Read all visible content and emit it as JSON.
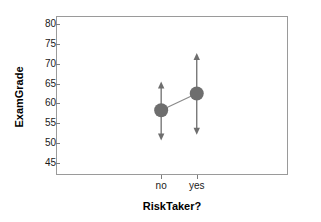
{
  "chart_data": {
    "type": "scatter",
    "title": "",
    "subtitle": "",
    "xlabel": "RiskTaker?",
    "ylabel": "ExamGrade",
    "categories": [
      "no",
      "yes"
    ],
    "values": [
      58.3,
      62.5
    ],
    "error_low": [
      50.7,
      52.1
    ],
    "error_high": [
      65.5,
      72.7
    ],
    "series": [
      {
        "name": "ExamGrade mean",
        "values": [
          58.3,
          62.5
        ],
        "error_low": [
          50.7,
          52.1
        ],
        "error_high": [
          65.5,
          72.7
        ]
      }
    ],
    "ylim": [
      42,
      82
    ],
    "xlim": [
      0,
      1
    ],
    "yticks": [
      45,
      50,
      55,
      60,
      65,
      70,
      75,
      80
    ],
    "ytick_labels": [
      "45",
      "50",
      "55",
      "60",
      "65",
      "70",
      "75",
      "80"
    ],
    "xtick_labels": [
      "no",
      "yes"
    ],
    "grid": false,
    "legend": false,
    "legend_position": "none",
    "marker": "circle",
    "error_bar_style": "double-headed-arrow",
    "connector_line": true,
    "colors": {
      "marker": "#6e6e6e",
      "error_bar": "#6e6e6e",
      "connector": "#8a8a8a",
      "frame": "#9a9a9a",
      "tick": "#7d7d7d",
      "text": "#1a1a1a",
      "title_text": "#000000",
      "background": "#ffffff"
    }
  }
}
